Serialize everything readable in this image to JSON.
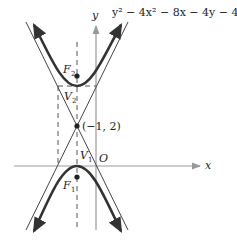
{
  "equation": "y² − 4x² − 8x − 4y − 4 = 0",
  "axes": {
    "x_label": "x",
    "y_label": "y",
    "origin_label": "O"
  },
  "points": {
    "center": {
      "label": "(−1, 2)",
      "x": -1,
      "y": 2
    },
    "vertex_upper": {
      "label": "V",
      "sub": "2"
    },
    "vertex_lower": {
      "label": "V",
      "sub": "1"
    },
    "focus_upper": {
      "label": "F",
      "sub": "2"
    },
    "focus_lower": {
      "label": "F",
      "sub": "1"
    }
  },
  "colors": {
    "curve": "#333333",
    "axis": "#999999",
    "asymptote": "#444444",
    "dashed": "#555555"
  }
}
